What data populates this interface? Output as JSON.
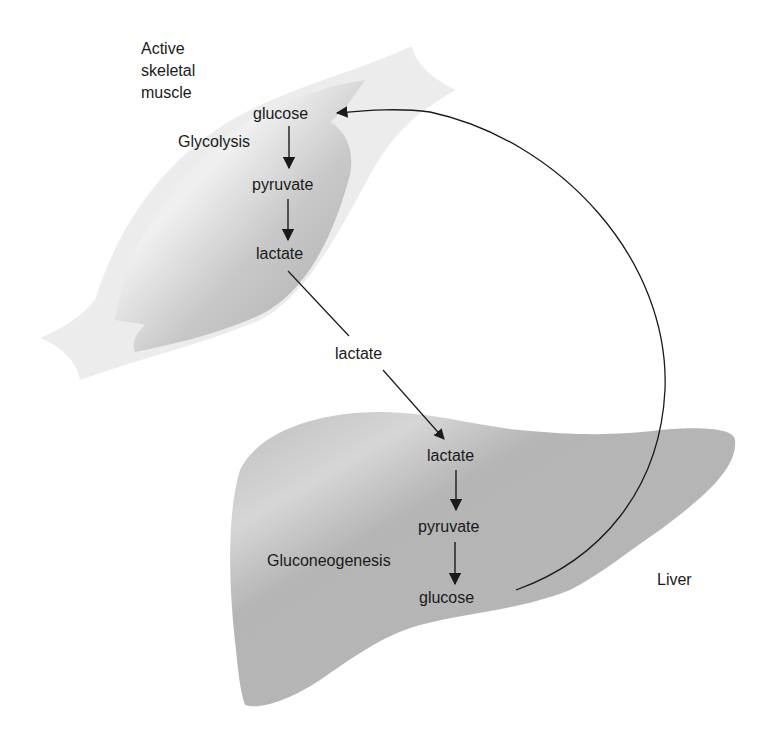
{
  "diagram": {
    "muscle": {
      "label_lines": [
        "Active",
        "skeletal",
        "muscle"
      ],
      "process_label": "Glycolysis",
      "steps": [
        "glucose",
        "pyruvate",
        "lactate"
      ]
    },
    "blood": {
      "transport_label": "lactate"
    },
    "liver": {
      "label": "Liver",
      "process_label": "Gluconeogenesis",
      "steps": [
        "lactate",
        "pyruvate",
        "glucose"
      ]
    },
    "colors": {
      "background": "#ffffff",
      "muscle_light": "#ececec",
      "muscle_dark": "#b9b9b9",
      "liver_fill": "#b8b8b8",
      "line": "#1a1a1a",
      "text": "#1a1a1a"
    }
  }
}
